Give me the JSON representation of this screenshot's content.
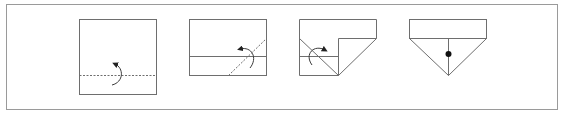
{
  "diagram": {
    "type": "origami-fold-steps",
    "step_count": 4,
    "colors": {
      "frame": "#9a9a9a",
      "line": "#6e6e6e",
      "fold_guide": "#6e6e6e",
      "arrow": "#3a3a3a",
      "dot": "#111111",
      "background": "#ffffff"
    },
    "steps": [
      {
        "index": 1,
        "description": "Square paper with dashed valley-fold line across lower part and curved fold-up arrow"
      },
      {
        "index": 2,
        "description": "Lower strip folded up; diagonal dashed line at right with curved fold arrow"
      },
      {
        "index": 3,
        "description": "Right corner folded; diagonal dashed line at left with curved fold arrow"
      },
      {
        "index": 4,
        "description": "Resulting pointed shape with center line and dot marker"
      }
    ]
  }
}
